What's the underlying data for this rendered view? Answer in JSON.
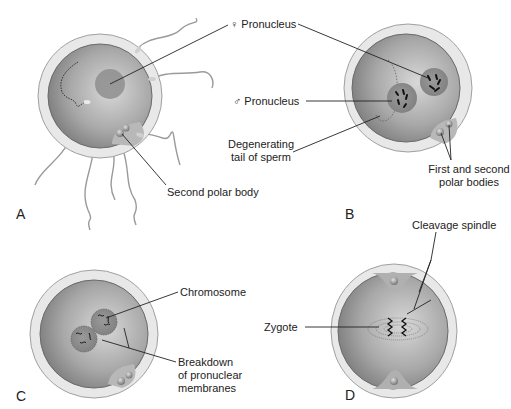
{
  "figure": {
    "colors": {
      "zona": "#e6e6e6",
      "zona_edge": "#9a9a9a",
      "cytoplasm_light": "#c8c8c8",
      "cytoplasm_dark": "#7a7a7a",
      "pronucleus": "#8d8d8d",
      "leader_line": "#222222"
    },
    "panels": [
      {
        "id": "A",
        "letter": "A",
        "labels": {
          "female_pronucleus": "♀ Pronucleus",
          "second_polar_body": "Second polar body"
        }
      },
      {
        "id": "B",
        "letter": "B",
        "labels": {
          "male_pronucleus": "♂ Pronucleus",
          "degenerating_tail_line1": "Degenerating",
          "degenerating_tail_line2": "tail of sperm",
          "polar_bodies_line1": "First and second",
          "polar_bodies_line2": "polar bodies"
        }
      },
      {
        "id": "C",
        "letter": "C",
        "labels": {
          "chromosome": "Chromosome",
          "breakdown_line1": "Breakdown",
          "breakdown_line2": "of pronuclear",
          "breakdown_line3": "membranes"
        }
      },
      {
        "id": "D",
        "letter": "D",
        "labels": {
          "cleavage_spindle": "Cleavage spindle",
          "zygote": "Zygote"
        }
      }
    ]
  }
}
